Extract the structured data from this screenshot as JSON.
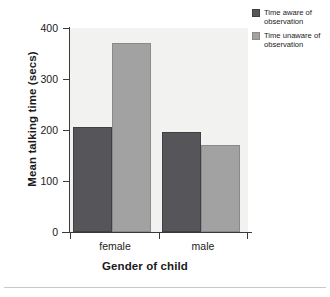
{
  "chart_data": {
    "type": "bar",
    "title": "",
    "xlabel": "Gender of child",
    "ylabel": "Mean talking time (secs)",
    "categories": [
      "female",
      "male"
    ],
    "series": [
      {
        "name": "Time aware of observation",
        "values": [
          205,
          197
        ],
        "color": "#55555a"
      },
      {
        "name": "Time unaware of observation",
        "values": [
          370,
          170
        ],
        "color": "#a2a2a2"
      }
    ],
    "ylim": [
      0,
      400
    ],
    "yticks": [
      0,
      100,
      200,
      300,
      400
    ],
    "ytick_labels": [
      "0",
      "100",
      "200",
      "300",
      "400"
    ],
    "grid": false,
    "legend_position": "right-top",
    "plot_background": "#f2f2f0"
  },
  "legend": {
    "entries": [
      {
        "label": "Time aware of observation"
      },
      {
        "label": "Time unaware of observation"
      }
    ]
  },
  "axes": {
    "y_title": "Mean talking time (secs)",
    "x_title": "Gender of child",
    "y_ticks": [
      "400",
      "300",
      "200",
      "100",
      "0"
    ],
    "x_ticks": [
      "female",
      "male"
    ]
  }
}
